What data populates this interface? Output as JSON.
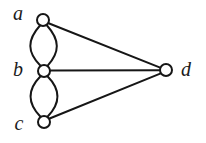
{
  "figure": {
    "kind": "undirected-multigraph-diagram",
    "background_color": "#ffffff",
    "line_color": "#161616",
    "vertex_fill_color": "#ffffff",
    "label_color": "#1b1b1b",
    "width": 206,
    "height": 143
  },
  "vertices": [
    {
      "id": "a",
      "label": "a",
      "cx": 43,
      "cy": 20,
      "r": 6,
      "label_x": 18,
      "label_y": 20
    },
    {
      "id": "b",
      "label": "b",
      "cx": 44,
      "cy": 71,
      "r": 6,
      "label_x": 18,
      "label_y": 76
    },
    {
      "id": "c",
      "label": "c",
      "cx": 44,
      "cy": 122,
      "r": 6,
      "label_x": 19,
      "label_y": 130
    },
    {
      "id": "d",
      "label": "d",
      "cx": 166,
      "cy": 70,
      "r": 6,
      "label_x": 180,
      "label_y": 76
    }
  ],
  "edges": [
    {
      "id": "a-b-left",
      "from": "a",
      "to": "b",
      "shape": "curve",
      "bulge": "left"
    },
    {
      "id": "a-b-right",
      "from": "a",
      "to": "b",
      "shape": "curve",
      "bulge": "right"
    },
    {
      "id": "b-c-left",
      "from": "b",
      "to": "c",
      "shape": "curve",
      "bulge": "left"
    },
    {
      "id": "b-c-right",
      "from": "b",
      "to": "c",
      "shape": "curve",
      "bulge": "right"
    },
    {
      "id": "a-d",
      "from": "a",
      "to": "d",
      "shape": "straight"
    },
    {
      "id": "b-d",
      "from": "b",
      "to": "d",
      "shape": "straight"
    },
    {
      "id": "c-d",
      "from": "c",
      "to": "d",
      "shape": "straight"
    }
  ],
  "paths": {
    "a_b_left": "M 40 25.5 C 27 40 27 52 40.5 65.8",
    "a_b_right": "M 47 25.5 C 60 40 60 52 47.5 65.8",
    "b_c_left": "M 40.5 76.3 C 27 90 27 103 40.5 116.8",
    "b_c_right": "M 47.5 76.3 C 61 90 61 103 47.5 116.8",
    "a_d": "M 48.6 23.2 L 160.2 67.6",
    "b_d": "M 50 70.6 L 160 70.2",
    "c_d": "M 49 118.8 L 160.8 73.4"
  }
}
